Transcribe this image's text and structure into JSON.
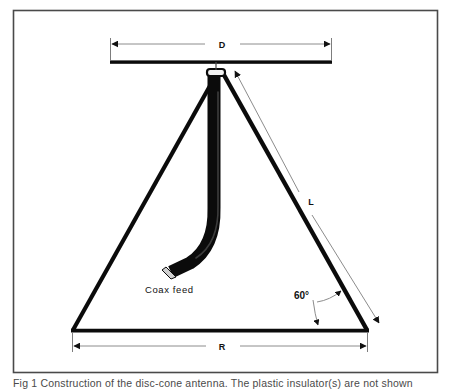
{
  "figure": {
    "caption": "Fig 1   Construction of the disc-cone antenna.  The plastic insulator(s) are not shown",
    "border_color": "#4a4a4a",
    "ink_color": "#000000",
    "thin_line_color": "#9a9a9a",
    "background": "#ffffff"
  },
  "dimensions": {
    "disc_diameter_label": "D",
    "cone_slant_label": "L",
    "cone_radius_label": "R",
    "cone_half_angle_label": "60°"
  },
  "parts": {
    "coax_feed_label": "Coax feed",
    "disc_name": "disc-reflector",
    "cone_name": "cone-element",
    "feed_point_name": "feed-point-insulator"
  },
  "geometry": {
    "border": {
      "x": 13,
      "y": 10,
      "w": 425,
      "h": 363
    },
    "disc": {
      "x1": 110,
      "x2": 332,
      "y": 62,
      "thickness": 3.5
    },
    "apex": {
      "x": 220,
      "y": 72
    },
    "cone_base": {
      "left_x": 72,
      "right_x": 368,
      "y": 330
    },
    "d_dim_line": {
      "y": 44,
      "x1": 110,
      "x2": 332
    },
    "r_dim_line": {
      "y": 346,
      "x1": 72,
      "x2": 368
    },
    "l_dim_line": {
      "x1": 236,
      "y1": 70,
      "x2": 380,
      "y2": 324
    },
    "coax": {
      "top_x": 220,
      "top_y": 74,
      "bend_y": 250,
      "end_x": 172,
      "end_y": 272
    }
  }
}
